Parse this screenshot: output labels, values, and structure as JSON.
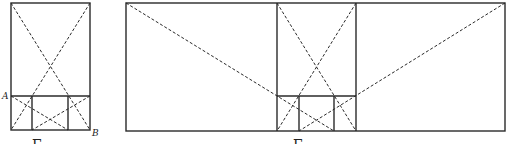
{
  "figure_left": {
    "point_labels": [
      "A",
      "B"
    ],
    "caption": "Б"
  },
  "figure_right": {
    "caption": "Б"
  },
  "colors": {
    "line": "#2a2a2a",
    "background": "#ffffff"
  }
}
